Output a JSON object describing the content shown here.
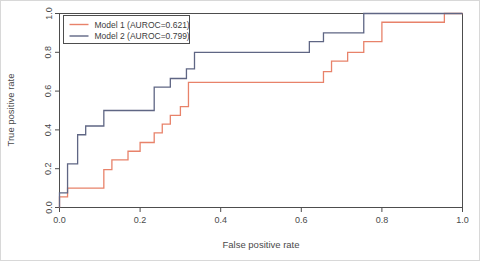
{
  "chart_data": {
    "type": "line",
    "title": "",
    "xlabel": "False positive rate",
    "ylabel": "True positive rate",
    "xlim": [
      0.0,
      1.0
    ],
    "ylim": [
      0.0,
      1.0
    ],
    "grid": false,
    "legend_position": "top-left",
    "xticks": [
      "0.0",
      "0.2",
      "0.4",
      "0.6",
      "0.8",
      "1.0"
    ],
    "xtick_values": [
      0.0,
      0.2,
      0.4,
      0.6,
      0.8,
      1.0
    ],
    "yticks": [
      "0.0",
      "0.2",
      "0.4",
      "0.6",
      "0.8",
      "1.0"
    ],
    "ytick_values": [
      0.0,
      0.2,
      0.4,
      0.6,
      0.8,
      1.0
    ],
    "series": [
      {
        "name": "Model 1 (AUROC=0.621)",
        "model": "Model 1",
        "auroc": 0.621,
        "color": "#e8826a",
        "step": "post",
        "x": [
          0.0,
          0.0,
          0.02,
          0.02,
          0.11,
          0.11,
          0.13,
          0.13,
          0.17,
          0.17,
          0.2,
          0.2,
          0.235,
          0.235,
          0.255,
          0.255,
          0.275,
          0.275,
          0.3,
          0.3,
          0.32,
          0.32,
          0.655,
          0.655,
          0.675,
          0.675,
          0.715,
          0.715,
          0.755,
          0.755,
          0.8,
          0.8,
          0.955,
          0.955,
          1.0
        ],
        "y": [
          0.0,
          0.055,
          0.055,
          0.1,
          0.1,
          0.195,
          0.195,
          0.245,
          0.245,
          0.29,
          0.29,
          0.335,
          0.335,
          0.385,
          0.385,
          0.43,
          0.43,
          0.475,
          0.475,
          0.52,
          0.52,
          0.645,
          0.645,
          0.7,
          0.7,
          0.755,
          0.755,
          0.8,
          0.8,
          0.855,
          0.855,
          0.955,
          0.955,
          1.0,
          1.0
        ]
      },
      {
        "name": "Model 2 (AUROC=0.799)",
        "model": "Model 2",
        "auroc": 0.799,
        "color": "#5f6684",
        "step": "post",
        "x": [
          0.0,
          0.0,
          0.02,
          0.02,
          0.045,
          0.045,
          0.065,
          0.065,
          0.11,
          0.11,
          0.235,
          0.235,
          0.275,
          0.275,
          0.315,
          0.315,
          0.335,
          0.335,
          0.62,
          0.62,
          0.655,
          0.655,
          0.755,
          0.755,
          1.0
        ],
        "y": [
          0.0,
          0.075,
          0.075,
          0.225,
          0.225,
          0.375,
          0.375,
          0.42,
          0.42,
          0.5,
          0.5,
          0.62,
          0.62,
          0.665,
          0.665,
          0.715,
          0.715,
          0.8,
          0.8,
          0.855,
          0.855,
          0.9,
          0.9,
          1.0,
          1.0
        ]
      }
    ]
  },
  "legend": {
    "entries": [
      {
        "label": "Model 1 (AUROC=0.621)",
        "color": "#e8826a"
      },
      {
        "label": "Model 2 (AUROC=0.799)",
        "color": "#5f6684"
      }
    ]
  },
  "axes": {
    "x_title": "False positive rate",
    "y_title": "True positive rate"
  }
}
